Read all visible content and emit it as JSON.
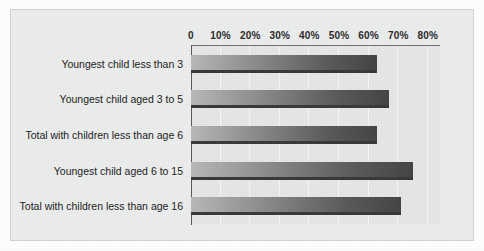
{
  "chart_data": {
    "type": "bar",
    "orientation": "horizontal",
    "title": "",
    "subtitle": "",
    "xlabel": "",
    "ylabel": "",
    "xlim": [
      0,
      80
    ],
    "grid": true,
    "legend": "none",
    "axis_ticks": [
      {
        "value": 0,
        "label": "0"
      },
      {
        "value": 10,
        "label": "10%"
      },
      {
        "value": 20,
        "label": "20%"
      },
      {
        "value": 30,
        "label": "30%"
      },
      {
        "value": 40,
        "label": "40%"
      },
      {
        "value": 50,
        "label": "50%"
      },
      {
        "value": 60,
        "label": "60%"
      },
      {
        "value": 70,
        "label": "70%"
      },
      {
        "value": 80,
        "label": "80%"
      }
    ],
    "categories": [
      "Youngest child less than 3",
      "Youngest child aged 3 to 5",
      "Total with children less than age 6",
      "Youngest child aged 6 to 15",
      "Total with children less than age 16"
    ],
    "values": [
      63,
      67,
      63,
      75,
      71
    ],
    "bars": [
      {
        "label": "Youngest child less than 3",
        "value": 63
      },
      {
        "label": "Youngest child aged 3 to 5",
        "value": 67
      },
      {
        "label": "Total with children less than age 6",
        "value": 63
      },
      {
        "label": "Youngest child aged 6 to 15",
        "value": 75
      },
      {
        "label": "Total with children less than age 16",
        "value": 71
      }
    ]
  },
  "style": {
    "panel_background": "#eceded",
    "plot_background": "#e6e7e7",
    "gridline_color": "#f7f7f7",
    "axis_color": "#5a5b5c",
    "bar_gradient_start": "#b9b9b9",
    "bar_gradient_end": "#454546",
    "bar_baseline_color": "#3a3a3b",
    "text_color": "#1d1d1d"
  }
}
